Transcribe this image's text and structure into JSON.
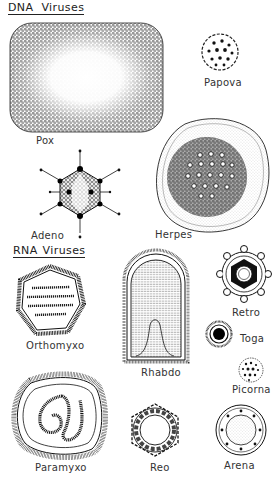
{
  "sections": {
    "dna": {
      "title_a": "DNA",
      "title_b": "Viruses"
    },
    "rna": {
      "title_a": "RNA",
      "title_b": "Viruses"
    }
  },
  "viruses": {
    "pox": {
      "label": "Pox",
      "group": "DNA"
    },
    "papova": {
      "label": "Papova",
      "group": "DNA"
    },
    "adeno": {
      "label": "Adeno",
      "group": "DNA"
    },
    "herpes": {
      "label": "Herpes",
      "group": "DNA"
    },
    "orthomyxo": {
      "label": "Orthomyxo",
      "group": "RNA"
    },
    "rhabdo": {
      "label": "Rhabdo",
      "group": "RNA"
    },
    "retro": {
      "label": "Retro",
      "group": "RNA"
    },
    "toga": {
      "label": "Toga",
      "group": "RNA"
    },
    "picorna": {
      "label": "Picorna",
      "group": "RNA"
    },
    "paramyxo": {
      "label": "Paramyxo",
      "group": "RNA"
    },
    "reo": {
      "label": "Reo",
      "group": "RNA"
    },
    "arena": {
      "label": "Arena",
      "group": "RNA"
    }
  },
  "colors": {
    "ink": "#1e1e1e",
    "paper": "#ffffff",
    "stipple": "#8a8a8a"
  }
}
